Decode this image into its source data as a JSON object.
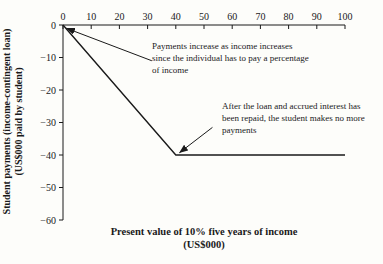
{
  "chart_data": {
    "type": "line",
    "title": "",
    "xlabel": "Present value of 10% five years of income (US$000)",
    "xlabel_lines": [
      "Present value of 10% five years of income",
      "(US$000)"
    ],
    "ylabel": "Student payments (income-contingent loan) (US$000 paid by student)",
    "ylabel_lines": [
      "Student payments (income-contingent loan)",
      "(US$000 paid by student)"
    ],
    "xlim": [
      0,
      100
    ],
    "ylim": [
      -60,
      0
    ],
    "x_ticks": [
      0,
      10,
      20,
      30,
      40,
      50,
      60,
      70,
      80,
      90,
      100
    ],
    "y_ticks": [
      0,
      -10,
      -20,
      -30,
      -40,
      -50,
      -60
    ],
    "grid": false,
    "axis_color": "#1a1a1a",
    "series": [
      {
        "name": "student-payments",
        "x": [
          0,
          40,
          100
        ],
        "y": [
          0,
          -40,
          -40
        ],
        "color": "#1a1a1a"
      }
    ],
    "annotations": [
      {
        "text": [
          "Payments increase as income increases",
          "since the individual has to pay a percentage",
          "of income"
        ],
        "arrow": {
          "from_x": 31.5,
          "from_y": -11,
          "to_x": 1.2,
          "to_y": -1
        }
      },
      {
        "text": [
          "After the loan and accrued interest has",
          "been repaid, the student makes no more",
          "payments"
        ],
        "arrow": {
          "from_x": 53,
          "from_y": -31.5,
          "to_x": 41.3,
          "to_y": -39.3
        }
      }
    ]
  }
}
